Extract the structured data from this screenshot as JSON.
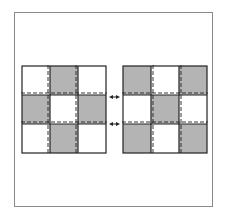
{
  "diagram": {
    "colors": {
      "fill_gray": "#b4b4b4",
      "fill_white": "#ffffff",
      "line": "#222222",
      "frame": "#8a8a8a"
    },
    "left_grid": {
      "pattern": [
        [
          "white",
          "gray",
          "white"
        ],
        [
          "gray",
          "white",
          "gray"
        ],
        [
          "white",
          "gray",
          "white"
        ]
      ]
    },
    "right_grid": {
      "pattern": [
        [
          "gray",
          "white",
          "gray"
        ],
        [
          "white",
          "gray",
          "white"
        ],
        [
          "gray",
          "white",
          "gray"
        ]
      ]
    },
    "arrows": [
      {
        "type": "double-headed",
        "row_boundary": 1
      },
      {
        "type": "double-headed",
        "row_boundary": 2
      }
    ]
  }
}
